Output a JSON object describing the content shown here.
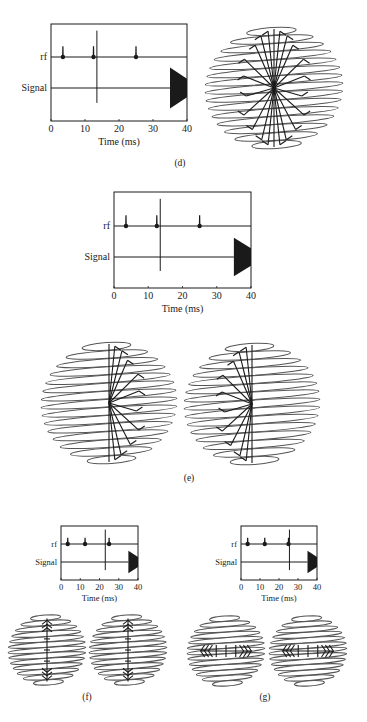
{
  "panels": [
    {
      "id": "d",
      "label": "(d)",
      "label_pos": [
        180,
        166
      ],
      "chart": {
        "box": [
          51,
          24,
          187,
          121
        ],
        "rf_y": 57,
        "signal_y": 88,
        "font": 10,
        "marker_ms": 13.5
      },
      "spheres": [
        {
          "cx": 274,
          "cy": 88,
          "rx": 69,
          "ry": 64,
          "rings": 15,
          "pattern": "fan-full"
        }
      ]
    },
    {
      "id": "e",
      "label": "(e)",
      "label_pos": [
        189,
        481
      ],
      "chart": {
        "box": [
          114,
          192,
          251,
          288
        ],
        "rf_y": 226,
        "signal_y": 257,
        "font": 10,
        "marker_ms": 13.5
      },
      "spheres": [
        {
          "cx": 109,
          "cy": 403,
          "rx": 68,
          "ry": 64,
          "rings": 15,
          "pattern": "fan-right"
        },
        {
          "cx": 252,
          "cy": 404,
          "rx": 68,
          "ry": 64,
          "rings": 15,
          "pattern": "fan-left"
        }
      ]
    },
    {
      "id": "f",
      "label": "(f)",
      "label_pos": [
        87,
        700
      ],
      "chart": {
        "box": [
          61,
          526,
          138,
          580
        ],
        "rf_y": 544,
        "signal_y": 562,
        "font": 8.5,
        "marker_ms": 23
      },
      "spheres": [
        {
          "cx": 47,
          "cy": 650,
          "rx": 39,
          "ry": 37,
          "rings": 13,
          "pattern": "vertical"
        },
        {
          "cx": 128,
          "cy": 650,
          "rx": 39,
          "ry": 37,
          "rings": 13,
          "pattern": "vertical"
        }
      ]
    },
    {
      "id": "g",
      "label": "(g)",
      "label_pos": [
        265,
        700
      ],
      "chart": {
        "box": [
          241,
          526,
          317,
          580
        ],
        "rf_y": 544,
        "signal_y": 562,
        "font": 8.5,
        "marker_ms": 25.5
      },
      "spheres": [
        {
          "cx": 226,
          "cy": 651,
          "rx": 39,
          "ry": 37,
          "rings": 13,
          "pattern": "horizontal"
        },
        {
          "cx": 308,
          "cy": 651,
          "rx": 39,
          "ry": 37,
          "rings": 13,
          "pattern": "horizontal"
        }
      ]
    }
  ],
  "axis": {
    "xlabel": "Time (ms)",
    "ylabels": {
      "rf": "rf",
      "signal": "Signal"
    },
    "xticks": [
      0,
      10,
      20,
      30,
      40
    ],
    "xlim": [
      0,
      40
    ]
  },
  "chart_data": {
    "type": "line",
    "title": "",
    "xlabel": "Time (ms)",
    "ylabel": "",
    "xlim": [
      0,
      40
    ],
    "x_ticks": [
      0,
      10,
      20,
      30,
      40
    ],
    "rows": [
      "rf",
      "Signal"
    ],
    "rf_pulses_ms": [
      3.5,
      12.5,
      25
    ],
    "signal_echo_ms": [
      35,
      40
    ],
    "time_markers_ms": {
      "d": 13.5,
      "e": 13.5,
      "f": 23,
      "g": 25.5
    },
    "grid": false
  },
  "colors": {
    "ink": "#1a1a1a",
    "ring": "#555555",
    "background": "#ffffff"
  }
}
